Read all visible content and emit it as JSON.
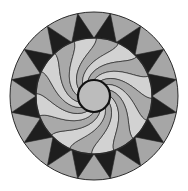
{
  "figure": {
    "width": 188,
    "height": 191,
    "center": [
      94,
      96
    ],
    "outer_radius": 84,
    "ring_inner_radius": 58,
    "hub_radius": 16,
    "star_points": 16,
    "swirl_blades": 16,
    "swirl_twist_deg": 70,
    "colors": {
      "background": "#ffffff",
      "dark_triangle": "#1e1e1e",
      "outer_gray": "#a6a6a6",
      "blade_light": "#d2d2d2",
      "blade_mid": "#a9a9a9",
      "hub": "#bcbcbc",
      "stroke": "#2a2a2a"
    }
  }
}
